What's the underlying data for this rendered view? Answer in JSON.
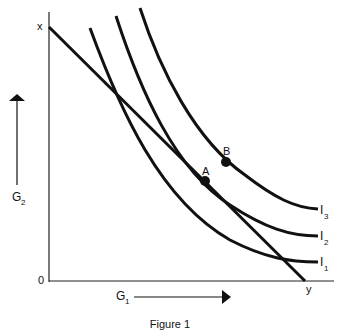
{
  "figure": {
    "caption": "Figure 1",
    "origin_label": "0",
    "x_axis_label": "G",
    "x_axis_sub": "1",
    "y_axis_label": "G",
    "y_axis_sub": "2",
    "budget_line": {
      "start_label": "x",
      "end_label": "y"
    },
    "curves": [
      {
        "label": "I",
        "sub": "1"
      },
      {
        "label": "I",
        "sub": "2"
      },
      {
        "label": "I",
        "sub": "3"
      }
    ],
    "points": [
      {
        "label": "A"
      },
      {
        "label": "B"
      }
    ],
    "colors": {
      "ink": "#111111",
      "background": "#ffffff"
    }
  }
}
